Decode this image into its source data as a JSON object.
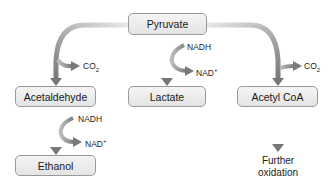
{
  "diagram": {
    "nodes": {
      "pyruvate": "Pyruvate",
      "acetaldehyde": "Acetaldehyde",
      "lactate": "Lactate",
      "acetyl_coa": "Acetyl CoA",
      "ethanol": "Ethanol",
      "further_oxidation_line1": "Further",
      "further_oxidation_line2": "oxidation"
    },
    "side_labels": {
      "co2_left": "CO",
      "co2_left_sub": "2",
      "co2_right": "CO",
      "co2_right_sub": "2",
      "nadh_lactate": "NADH",
      "nad_lactate": "NAD",
      "nad_lactate_sup": "+",
      "nadh_ethanol": "NADH",
      "nad_ethanol": "NAD",
      "nad_ethanol_sup": "+"
    },
    "edges": [
      {
        "from": "Pyruvate",
        "to": "Acetaldehyde",
        "byproduct": "CO2"
      },
      {
        "from": "Pyruvate",
        "to": "Lactate",
        "cofactor_in": "NADH",
        "cofactor_out": "NAD+"
      },
      {
        "from": "Pyruvate",
        "to": "Acetyl CoA",
        "byproduct": "CO2"
      },
      {
        "from": "Acetaldehyde",
        "to": "Ethanol",
        "cofactor_in": "NADH",
        "cofactor_out": "NAD+"
      },
      {
        "from": "Acetyl CoA",
        "to": "Further oxidation"
      }
    ],
    "colors": {
      "arrow": "#8a8a8a",
      "box_fill": "#ebebeb",
      "box_border": "#9a9a9a"
    }
  }
}
